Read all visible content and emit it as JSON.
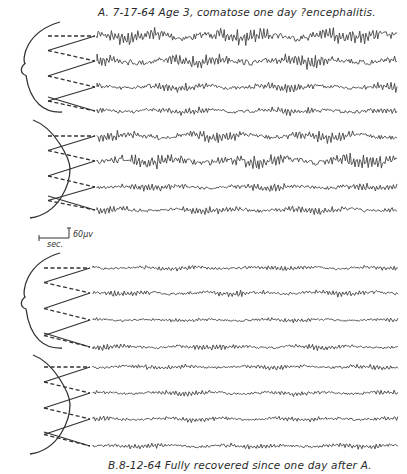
{
  "figure": {
    "panel_a": {
      "caption": "A. 7-17-64  Age 3, comatose one day ?encephalitis.",
      "montages": [
        {
          "name": "upper-montage",
          "channels": 4,
          "trace_y": [
            36,
            61,
            87,
            111
          ],
          "amplitude": [
            7,
            6,
            4,
            3.5
          ]
        },
        {
          "name": "lower-montage",
          "channels": 4,
          "trace_y": [
            136,
            161,
            187,
            210
          ],
          "amplitude": [
            5,
            6.5,
            3.5,
            3.5
          ]
        }
      ]
    },
    "panel_b": {
      "caption": "B.8-12-64  Fully recovered since one day after A.",
      "montages": [
        {
          "name": "upper-montage",
          "channels": 4,
          "trace_y": [
            268,
            293,
            320,
            347
          ],
          "amplitude": [
            2.5,
            3,
            2,
            2.5
          ]
        },
        {
          "name": "lower-montage",
          "channels": 4,
          "trace_y": [
            367,
            393,
            419,
            446
          ],
          "amplitude": [
            2.5,
            2.5,
            2.5,
            2.5
          ]
        }
      ]
    },
    "calibration": {
      "time_label": "sec.",
      "voltage_label": "60µv"
    },
    "colors": {
      "ink": "#333333",
      "background": "#ffffff"
    }
  }
}
